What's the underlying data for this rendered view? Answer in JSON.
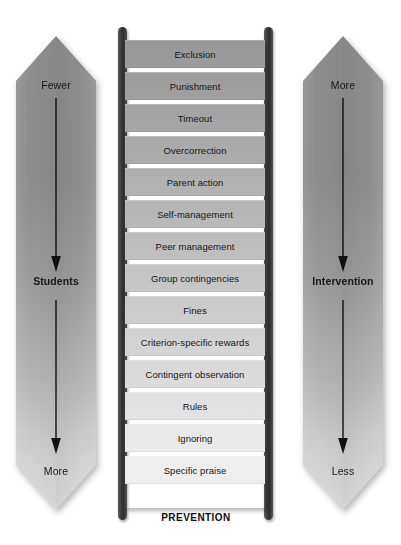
{
  "figure": {
    "type": "diagram",
    "subtype": "ladder-of-behavioral-interventions",
    "bottom_caption": "PREVENTION"
  },
  "left_band": {
    "name": "students-axis",
    "top_label": "Fewer",
    "middle_label": "Students",
    "bottom_label": "More",
    "direction": "down"
  },
  "right_band": {
    "name": "intervention-axis",
    "top_label": "More",
    "middle_label": "Intervention",
    "bottom_label": "Less",
    "direction": "down"
  },
  "ladder": {
    "rungs": [
      {
        "label": "Exclusion"
      },
      {
        "label": "Punishment"
      },
      {
        "label": "Timeout"
      },
      {
        "label": "Overcorrection"
      },
      {
        "label": "Parent action"
      },
      {
        "label": "Self-management"
      },
      {
        "label": "Peer management"
      },
      {
        "label": "Group contingencies"
      },
      {
        "label": "Fines"
      },
      {
        "label": "Criterion-specific rewards"
      },
      {
        "label": "Contingent observation"
      },
      {
        "label": "Rules"
      },
      {
        "label": "Ignoring"
      },
      {
        "label": "Specific praise"
      }
    ]
  },
  "colors": {
    "background": "#ffffff",
    "band_top": "#8d8d8d",
    "band_bottom": "#dedede",
    "rail": "#343434",
    "rung_top": "#9a9a9a",
    "rung_bottom": "#ececec",
    "text": "#161616"
  }
}
